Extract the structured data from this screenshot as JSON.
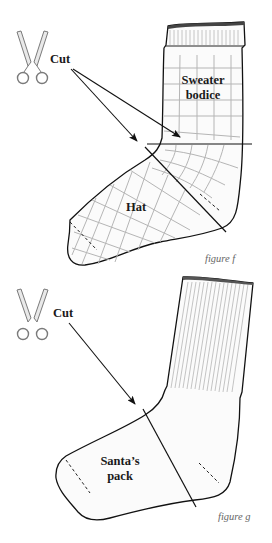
{
  "figure_f": {
    "cut_label": "Cut",
    "region_top_line1": "Sweater",
    "region_top_line2": "bodice",
    "region_foot": "Hat",
    "caption": "figure f",
    "icon": "scissors-icon"
  },
  "figure_g": {
    "cut_label": "Cut",
    "region_foot_line1": "Santa’s",
    "region_foot_line2": "pack",
    "caption": "figure g",
    "icon": "scissors-icon"
  },
  "colors": {
    "outline": "#111111",
    "grid": "#b5b5b5",
    "scissors": "#7a7a7a",
    "caption": "#666666"
  }
}
